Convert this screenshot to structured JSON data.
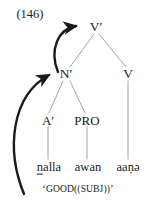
{
  "figure": {
    "example_number": "(146)",
    "gloss": {
      "open_quote": "ʻ",
      "predicate": "GOOD",
      "arguments": "((SUBJ))",
      "close_quote": "ʼ",
      "full_text": "ʻGOOD((SUBJ))ʼ"
    },
    "colors": {
      "background": "#ffffff",
      "text": "#1a1a1a",
      "tree_line": "#9a9a9a",
      "arrow": "#1a1a1a"
    }
  },
  "tree": {
    "nodes": [
      {
        "id": "vbar",
        "label": "V′",
        "x": 96,
        "y": 27
      },
      {
        "id": "nbar",
        "label": "N′",
        "x": 66,
        "y": 74
      },
      {
        "id": "v",
        "label": "V",
        "x": 128,
        "y": 74
      }
    ],
    "preterminals": [
      {
        "id": "abar",
        "label": "A′",
        "x": 48,
        "y": 120
      },
      {
        "id": "pro",
        "label": "PRO",
        "x": 87,
        "y": 120
      }
    ],
    "terminals": [
      {
        "id": "word-nalla",
        "label": "ṉalla",
        "prefix": "n",
        "rest": "alla",
        "x": 49,
        "y": 167
      },
      {
        "id": "word-awan",
        "label": "awan",
        "x": 88,
        "y": 167
      },
      {
        "id": "word-aana",
        "label": "aaṇə",
        "x": 128,
        "y": 167
      }
    ],
    "branches": [
      {
        "from": "vbar",
        "to": "nbar"
      },
      {
        "from": "vbar",
        "to": "v"
      },
      {
        "from": "nbar",
        "to": "abar"
      },
      {
        "from": "nbar",
        "to": "pro"
      },
      {
        "from": "abar",
        "to": "word-nalla"
      },
      {
        "from": "pro",
        "to": "word-awan"
      },
      {
        "from": "v",
        "to": "word-aana"
      }
    ]
  },
  "arrows": [
    {
      "id": "arrow-nbar-to-vbar",
      "description": "curved arrow from N-bar up to V-bar",
      "from_node": "N′",
      "to_node": "V′"
    },
    {
      "id": "arrow-gloss-to-nbar",
      "description": "long curved arrow from the gloss line up to N-bar",
      "from_node": "ʻGOOD((SUBJ))ʼ",
      "to_node": "N′"
    }
  ]
}
